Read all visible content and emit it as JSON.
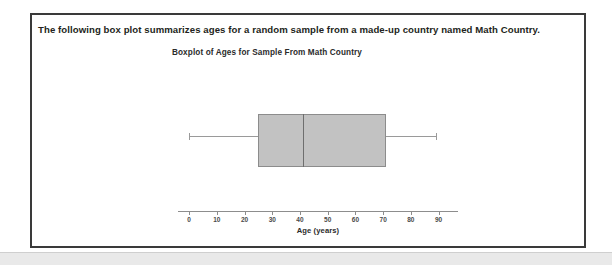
{
  "prompt": {
    "text": "The following box plot summarizes ages for a random sample from a made-up country named Math Country."
  },
  "chart_data": {
    "type": "boxplot",
    "title": "Boxplot of Ages for Sample From Math Country",
    "xlabel": "Age (years)",
    "ylabel": "",
    "orientation": "horizontal",
    "xlim": [
      -4,
      97
    ],
    "ticks": [
      0,
      10,
      20,
      30,
      40,
      50,
      60,
      70,
      80,
      90
    ],
    "tick_labels": [
      "0",
      "10",
      "20",
      "30",
      "40",
      "50",
      "60",
      "70",
      "80",
      "90"
    ],
    "grid": false,
    "legend": null,
    "series": [
      {
        "name": "Ages",
        "min": 0,
        "q1": 25,
        "median": 41,
        "q3": 71,
        "max": 89,
        "outliers": []
      }
    ],
    "colors": {
      "box_fill": "#c2c2c2",
      "box_edge": "#8c8c8c",
      "median": "#6e6e6e",
      "whisker": "#9a9a9a",
      "axis": "#8d8d8d"
    }
  },
  "frame": {
    "border_color": "#3a3a3a"
  }
}
